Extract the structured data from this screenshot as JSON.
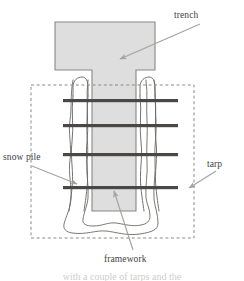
{
  "figure": {
    "kind": "labeled-cross-section-diagram",
    "width": 244,
    "height": 281,
    "background_color": "#ffffff"
  },
  "colors": {
    "trench_fill": "#dedede",
    "trench_stroke": "#8a8885",
    "snow_outline": "#6d6a67",
    "tarp_dash": "#8d8a87",
    "bar_fill": "#4a4744",
    "post_stroke": "#6d6a67",
    "arrow": "#a5a3a0",
    "label_text": "#44413f",
    "caption_text": "#cfcdcb"
  },
  "labels": {
    "trench": "trench",
    "snow_pile": "snow pile",
    "tarp": "tarp",
    "framework": "framework"
  },
  "caption": {
    "cut_off_line": "with a couple of tarps and the"
  },
  "parts": {
    "trench": {
      "name": "trench",
      "shape": "T-shaped shaded cavity",
      "head_left": 55,
      "head_right": 155,
      "head_top": 22,
      "head_bottom": 70,
      "shaft_left": 92,
      "shaft_right": 136,
      "shaft_bottom": 211
    },
    "tarp": {
      "name": "tarp",
      "shape": "dashed rectangle",
      "left": 31,
      "top": 85,
      "right": 194,
      "bottom": 238
    },
    "framework": {
      "name": "framework",
      "horizontal_bar_count": 4,
      "horizontal_bar_y": [
        101,
        126,
        155,
        188
      ],
      "bar_left": 63,
      "bar_right": 178,
      "vertical_post_count": 4,
      "post_x": [
        73,
        88,
        140,
        155
      ],
      "post_top": 79
    },
    "snow_pile": {
      "name": "snow pile",
      "shape": "hand drawn wavy outline with rounded base",
      "outer_left": 62,
      "outer_right": 170,
      "base_y": 234
    }
  },
  "arrows": [
    {
      "name": "trench-arrow",
      "from_x": 200,
      "from_y": 24,
      "to_x": 118,
      "to_y": 60
    },
    {
      "name": "snow-pile-arrow",
      "from_x": 32,
      "from_y": 166,
      "to_x": 78,
      "to_y": 184
    },
    {
      "name": "tarp-arrow",
      "from_x": 215,
      "from_y": 172,
      "to_x": 188,
      "to_y": 188
    },
    {
      "name": "framework-arrow",
      "from_x": 132,
      "from_y": 250,
      "to_x": 114,
      "to_y": 190
    }
  ]
}
